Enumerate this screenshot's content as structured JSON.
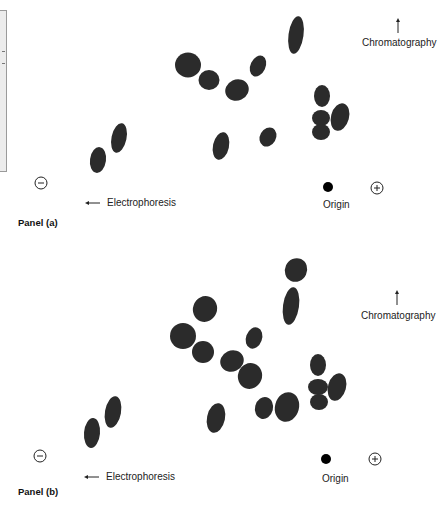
{
  "figure": {
    "panels": [
      {
        "id": "a",
        "label": "Panel (a)",
        "chromatography_label": "Chromatography",
        "electrophoresis_label": "Electrophoresis",
        "origin_label": "Origin",
        "negative_electrode": "⊖",
        "positive_electrode": "⊕",
        "spot_count": 13
      },
      {
        "id": "b",
        "label": "Panel (b)",
        "chromatography_label": "Chromatography",
        "electrophoresis_label": "Electrophoresis",
        "origin_label": "Origin",
        "negative_electrode": "⊖",
        "positive_electrode": "⊕",
        "spot_count": 17
      }
    ],
    "colors": {
      "spot": "#2b2b2b",
      "origin_dot": "#000000",
      "text": "#222222",
      "side_box": "#ececec"
    }
  }
}
